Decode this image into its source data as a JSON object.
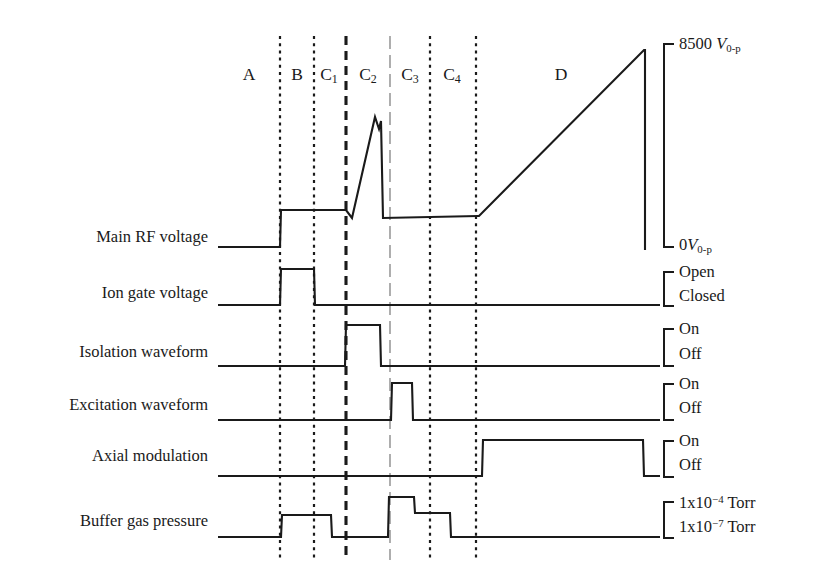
{
  "figure": {
    "background": "#ffffff",
    "ink_color": "#1a1a1a",
    "light_divider_color": "#9a9a9a"
  },
  "regions": [
    {
      "id": "A",
      "label": "A",
      "sub": "",
      "center_x": 249
    },
    {
      "id": "B",
      "label": "B",
      "sub": "",
      "center_x": 297
    },
    {
      "id": "C1",
      "label": "C",
      "sub": "1",
      "center_x": 329
    },
    {
      "id": "C2",
      "label": "C",
      "sub": "2",
      "center_x": 368
    },
    {
      "id": "C3",
      "label": "C",
      "sub": "3",
      "center_x": 410
    },
    {
      "id": "C4",
      "label": "C",
      "sub": "4",
      "center_x": 452
    },
    {
      "id": "D",
      "label": "D",
      "sub": "",
      "center_x": 561
    }
  ],
  "dividers": [
    {
      "x": 280,
      "style": "dotted",
      "y1": 36,
      "y2": 560
    },
    {
      "x": 314,
      "style": "dotted",
      "y1": 36,
      "y2": 560
    },
    {
      "x": 346,
      "style": "dashed-heavy",
      "y1": 36,
      "y2": 560
    },
    {
      "x": 390,
      "style": "dashdot-light",
      "y1": 36,
      "y2": 560
    },
    {
      "x": 430,
      "style": "dotted",
      "y1": 36,
      "y2": 560
    },
    {
      "x": 476,
      "style": "dotted",
      "y1": 36,
      "y2": 560
    }
  ],
  "rows": [
    {
      "name": "main-rf-voltage",
      "label": "Main RF voltage",
      "label_y": 229,
      "scale": {
        "top_label_html": "8500 V0-p",
        "top_text": "8500",
        "top_unit_base": "V",
        "top_unit_sub": "0-p",
        "bottom_text": "0",
        "bottom_unit_base": "V",
        "bottom_unit_sub": "0-p",
        "bracket_x": 664,
        "bracket_top_y": 44,
        "bracket_bottom_y": 247,
        "bracket_tick": 10,
        "top_label_y": 36,
        "bottom_label_y": 237
      },
      "points": "218,247 280,247 281,210 346,210 352,218 375,117 379,129 381,121 383,218 478,216 479,216 644,50 645,50 645,250"
    },
    {
      "name": "ion-gate-voltage",
      "label": "Ion gate voltage",
      "label_y": 285,
      "scale": {
        "top_text": "Open",
        "bottom_text": "Closed",
        "bracket_x": 664,
        "bracket_top_y": 272,
        "bracket_bottom_y": 306,
        "bracket_tick": 10,
        "top_label_y": 264,
        "bottom_label_y": 288
      },
      "points": "218,305 280,305 281,269 314,269 315,305 660,305"
    },
    {
      "name": "isolation-waveform",
      "label": "Isolation waveform",
      "label_y": 344,
      "scale": {
        "top_text": "On",
        "bottom_text": "Off",
        "bracket_x": 664,
        "bracket_top_y": 329,
        "bracket_bottom_y": 366,
        "bracket_tick": 10,
        "top_label_y": 321,
        "bottom_label_y": 346
      },
      "points": "218,366 345,366 346,325 380,325 381,366 660,366"
    },
    {
      "name": "excitation-waveform",
      "label": "Excitation waveform",
      "label_y": 397,
      "scale": {
        "top_text": "On",
        "bottom_text": "Off",
        "bracket_x": 664,
        "bracket_top_y": 384,
        "bracket_bottom_y": 420,
        "bracket_tick": 10,
        "top_label_y": 376,
        "bottom_label_y": 400
      },
      "points": "218,420 391,420 392,383 412,383 413,420 660,420"
    },
    {
      "name": "axial-modulation",
      "label": "Axial modulation",
      "label_y": 448,
      "scale": {
        "top_text": "On",
        "bottom_text": "Off",
        "bracket_x": 664,
        "bracket_top_y": 441,
        "bracket_bottom_y": 477,
        "bracket_tick": 10,
        "top_label_y": 433,
        "bottom_label_y": 457
      },
      "points": "218,476 482,476 483,440 643,440 644,476 660,476"
    },
    {
      "name": "buffer-gas-pressure",
      "label": "Buffer gas pressure",
      "label_y": 513,
      "scale": {
        "top_text": "1x10",
        "top_exp": "-4",
        "top_unit": " Torr",
        "bottom_text": "1x10",
        "bottom_exp": "-7",
        "bottom_unit": " Torr",
        "bracket_x": 664,
        "bracket_top_y": 502,
        "bracket_bottom_y": 538,
        "bracket_tick": 10,
        "top_label_y": 494,
        "bottom_label_y": 518
      },
      "points": "218,537 281,537 282,515 331,515 332,537 388,537 389,497 414,497 415,513 450,513 451,537 660,537"
    }
  ]
}
